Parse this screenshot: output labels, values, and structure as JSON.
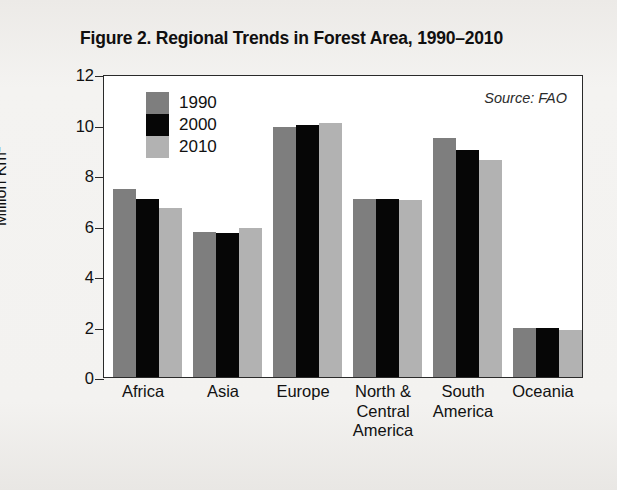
{
  "figure": {
    "title": "Figure 2. Regional Trends in Forest Area, 1990–2010",
    "source_note": "Source: FAO",
    "background_color": "#f1f0ee",
    "plot_background_color": "#ffffff",
    "axis_color": "#2a2a2a"
  },
  "legend": {
    "position": "top-left-inside",
    "entries": [
      {
        "label": "1990",
        "color": "#7e7e7e",
        "swatch_name": "legend-swatch-1990"
      },
      {
        "label": "2000",
        "color": "#060606",
        "swatch_name": "legend-swatch-2000"
      },
      {
        "label": "2010",
        "color": "#b2b2b2",
        "swatch_name": "legend-swatch-2010"
      }
    ]
  },
  "chart_data": {
    "type": "bar",
    "title": "Figure 2. Regional Trends in Forest Area, 1990–2010",
    "subtitle": "",
    "xlabel": "",
    "ylabel": "Million Km2",
    "ylabel_display": "Million Km",
    "ylabel_superscript": "2",
    "ylim": [
      0,
      12
    ],
    "yticks": [
      0,
      2,
      4,
      6,
      8,
      10,
      12
    ],
    "ytick_labels": [
      "0",
      "2",
      "4",
      "6",
      "8",
      "10",
      "12"
    ],
    "grid": false,
    "legend_position": "upper left",
    "annotations": [
      "Source: FAO"
    ],
    "categories": [
      "Africa",
      "Asia",
      "Europe",
      "North & Central America",
      "South America",
      "Oceania"
    ],
    "category_label_lines": [
      [
        "Africa"
      ],
      [
        "Asia"
      ],
      [
        "Europe"
      ],
      [
        "North &",
        "Central",
        "America"
      ],
      [
        "South",
        "America"
      ],
      [
        "Oceania"
      ]
    ],
    "series": [
      {
        "name": "1990",
        "color": "#7e7e7e",
        "values": [
          7.45,
          5.75,
          9.9,
          7.05,
          9.45,
          1.95
        ]
      },
      {
        "name": "2000",
        "color": "#060606",
        "values": [
          7.05,
          5.7,
          10.0,
          7.05,
          9.0,
          1.95
        ]
      },
      {
        "name": "2010",
        "color": "#b2b2b2",
        "values": [
          6.7,
          5.9,
          10.05,
          7.0,
          8.6,
          1.85
        ]
      }
    ]
  }
}
